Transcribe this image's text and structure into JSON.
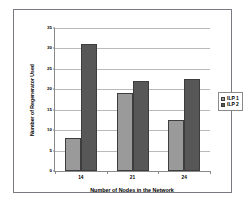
{
  "chart_data": {
    "type": "bar",
    "title": "",
    "xlabel": "Number of Nodes in the Network",
    "ylabel": "Number of Regenerator Used",
    "categories": [
      "14",
      "21",
      "24"
    ],
    "series": [
      {
        "name": "ILP 1",
        "color": "#9a9a9a",
        "values": [
          8,
          19,
          12.5
        ]
      },
      {
        "name": "ILP 2",
        "color": "#575757",
        "values": [
          31,
          22,
          22.5
        ]
      }
    ],
    "ylim": [
      0,
      35
    ],
    "yticks": [
      0,
      5,
      10,
      15,
      20,
      25,
      30,
      35
    ],
    "ytick_labels": [
      "0",
      "5",
      "10",
      "15",
      "20",
      "25",
      "30",
      "35"
    ],
    "grid": "horizontal",
    "legend_position": "right",
    "bar_border_color": "#3d3d3d",
    "axis_color": "#8a8a8a",
    "gridline_color": "#b9b9b9",
    "frame_color": "#7a7a85",
    "background": "#ffffff"
  }
}
